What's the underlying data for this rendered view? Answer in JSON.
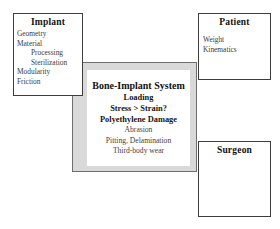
{
  "diagram": {
    "colors": {
      "box_border": "#3d3d3d",
      "center_fill": "#d9d9d9",
      "center_border": "#6e6e6e",
      "inner_fill": "#ffffff",
      "background": "#ffffff"
    },
    "boxes": {
      "implant": {
        "title": "Implant",
        "items": [
          {
            "label": "Geometry",
            "indent": false
          },
          {
            "label": "Material",
            "indent": false
          },
          {
            "label": "Processing",
            "indent": true
          },
          {
            "label": "Sterilization",
            "indent": true
          },
          {
            "label": "Modularity",
            "indent": false
          },
          {
            "label": "Friction",
            "indent": false
          }
        ]
      },
      "patient": {
        "title": "Patient",
        "items": [
          {
            "label": "Weight",
            "indent": false
          },
          {
            "label": "Kinematics",
            "indent": false
          }
        ]
      },
      "surgeon": {
        "title": "Surgeon",
        "items": []
      },
      "system": {
        "lines": [
          {
            "text": "Bone-Implant System",
            "style": "title"
          },
          {
            "text": "Loading",
            "style": "bold"
          },
          {
            "text": "Stress > Strain?",
            "style": "bold"
          },
          {
            "text": "Polyethylene Damage",
            "style": "bold"
          },
          {
            "text": "Abrasion",
            "style": "plain"
          },
          {
            "text": "Pitting, Delamination",
            "style": "plain"
          },
          {
            "text": "Third-body wear",
            "style": "plain"
          }
        ]
      }
    }
  }
}
